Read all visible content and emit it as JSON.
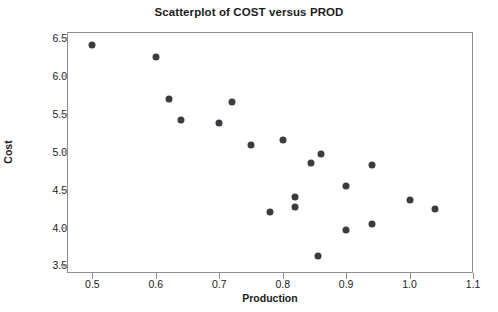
{
  "chart_data": {
    "type": "scatter",
    "title": "Scatterplot of COST versus PROD",
    "xlabel": "Production",
    "ylabel": "Cost",
    "xlim": [
      0.46,
      1.1
    ],
    "ylim": [
      3.4,
      6.58
    ],
    "grid": false,
    "legend": null,
    "marker_color": "#3c3c40",
    "frame_color": "#8e8e8e",
    "xticks": [
      "0.5",
      "0.6",
      "0.7",
      "0.8",
      "0.9",
      "1.0",
      "1.1"
    ],
    "xtick_values": [
      0.5,
      0.6,
      0.7,
      0.8,
      0.9,
      1.0,
      1.1
    ],
    "yticks": [
      "3.5",
      "4.0",
      "4.5",
      "5.0",
      "5.5",
      "6.0",
      "6.5"
    ],
    "ytick_values": [
      3.5,
      4.0,
      4.5,
      5.0,
      5.5,
      6.0,
      6.5
    ],
    "series": [
      {
        "name": "COST vs PROD",
        "x": [
          0.5,
          0.6,
          0.62,
          0.64,
          0.7,
          0.72,
          0.75,
          0.78,
          0.8,
          0.82,
          0.82,
          0.845,
          0.855,
          0.86,
          0.9,
          0.9,
          0.94,
          0.94,
          1.0,
          1.04
        ],
        "y": [
          6.41,
          6.25,
          5.7,
          5.42,
          5.38,
          5.66,
          5.09,
          4.21,
          5.15,
          4.4,
          4.27,
          4.85,
          3.63,
          4.97,
          4.55,
          3.97,
          4.82,
          4.05,
          4.36,
          4.25
        ]
      }
    ]
  }
}
